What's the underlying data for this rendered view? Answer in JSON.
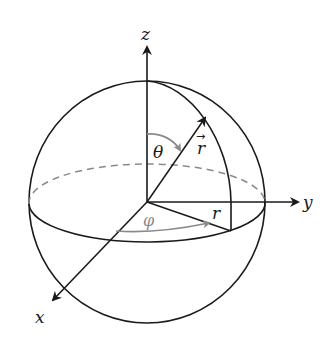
{
  "diagram": {
    "type": "spherical-coordinates",
    "labels": {
      "z_axis": "z",
      "y_axis": "y",
      "x_axis": "x",
      "theta": "θ",
      "phi": "φ",
      "r_vector": "r",
      "r_vector_arrow": "→",
      "r_projection": "r"
    },
    "colors": {
      "line": "#1a1a1a",
      "annotation": "#8a8a8a",
      "dashed": "#8a8a8a",
      "background": "#ffffff"
    }
  }
}
